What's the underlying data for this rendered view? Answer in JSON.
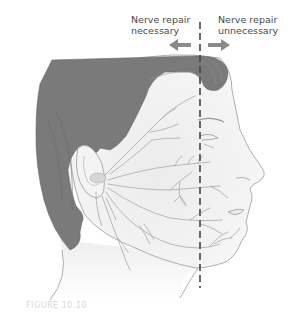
{
  "figure": {
    "type": "anatomical-illustration",
    "labels": {
      "left": {
        "line1": "Nerve repair",
        "line2": "necessary"
      },
      "right": {
        "line1": "Nerve repair",
        "line2": "unnecessary"
      }
    },
    "arrows": {
      "left": "arrow-left",
      "right": "arrow-right"
    },
    "divider": "dashed-vertical-line",
    "caption": "FIGURE 10.10"
  },
  "colors": {
    "hair": "#7a7a7a",
    "skin": "#f2f2f2",
    "outline": "#9a9a9a",
    "nerve": "#b0b0b0",
    "arrow": "#8a8a8a",
    "dashed_line": "#444444",
    "text": "#4a4a4a"
  }
}
